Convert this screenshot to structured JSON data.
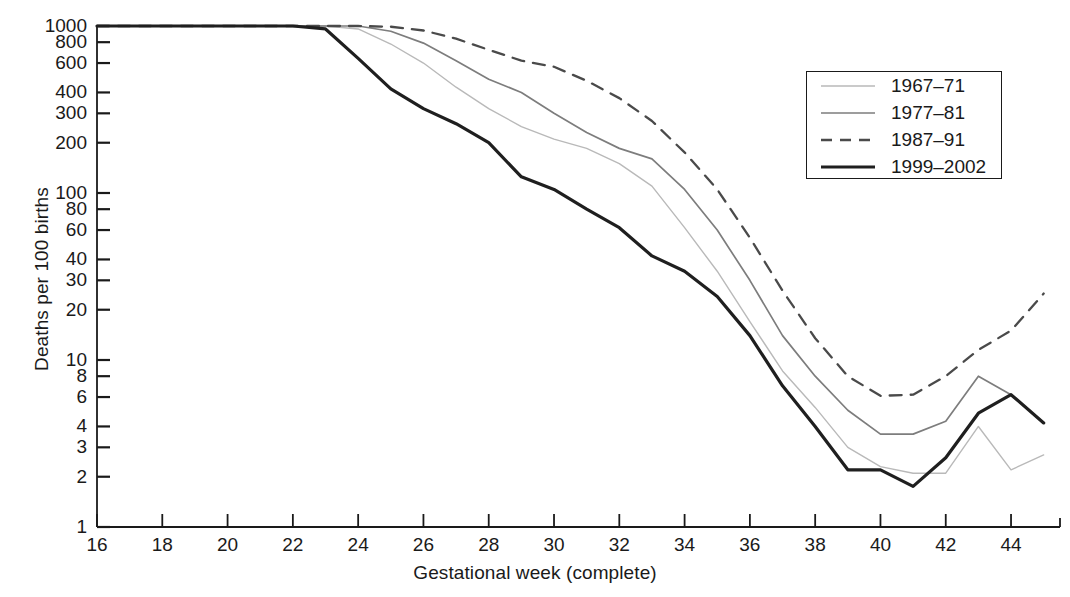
{
  "chart_data": {
    "type": "line",
    "title": "",
    "xlabel": "Gestational week (complete)",
    "ylabel": "Deaths per 100 births",
    "xlim": [
      16,
      45.5
    ],
    "ylim": [
      1,
      1000
    ],
    "yscale": "log",
    "grid": false,
    "legend_position": "top-right",
    "x_ticks": [
      16,
      18,
      20,
      22,
      24,
      26,
      28,
      30,
      32,
      34,
      36,
      38,
      40,
      42,
      44
    ],
    "x_tick_labels": [
      "16",
      "18",
      "20",
      "22",
      "24",
      "26",
      "28",
      "30",
      "32",
      "34",
      "36",
      "38",
      "40",
      "42",
      "44"
    ],
    "y_ticks": [
      1000,
      800,
      600,
      400,
      300,
      200,
      100,
      80,
      60,
      40,
      30,
      20,
      10,
      8,
      6,
      4,
      3,
      2,
      1
    ],
    "y_tick_labels": [
      "1000",
      "800",
      "600",
      "400",
      "300",
      "200",
      "100",
      "80",
      "60",
      "40",
      "30",
      "20",
      "10",
      "8",
      "6",
      "4",
      "3",
      "2",
      "1"
    ],
    "series": [
      {
        "name": "1967-71",
        "style": "solid",
        "color": "#b9b9b9",
        "width": 1.4,
        "x": [
          16,
          17,
          18,
          19,
          20,
          21,
          22,
          23,
          24,
          25,
          26,
          27,
          28,
          29,
          30,
          31,
          32,
          33,
          34,
          35,
          36,
          37,
          38,
          39,
          40,
          41,
          42,
          43,
          44,
          45
        ],
        "y": [
          1000,
          1000,
          1000,
          1000,
          1000,
          1000,
          1000,
          1000,
          960,
          780,
          600,
          430,
          320,
          250,
          210,
          185,
          150,
          110,
          62,
          34,
          17,
          8.6,
          5.2,
          3.0,
          2.3,
          2.1,
          2.1,
          4.0,
          2.2,
          2.7
        ]
      },
      {
        "name": "1977-81",
        "style": "solid",
        "color": "#7d7d7d",
        "width": 1.7,
        "x": [
          16,
          17,
          18,
          19,
          20,
          21,
          22,
          23,
          24,
          25,
          26,
          27,
          28,
          29,
          30,
          31,
          32,
          33,
          34,
          35,
          36,
          37,
          38,
          39,
          40,
          41,
          42,
          43,
          44,
          45
        ],
        "y": [
          1000,
          1000,
          1000,
          1000,
          1000,
          1000,
          1000,
          1000,
          1000,
          930,
          790,
          620,
          480,
          400,
          300,
          230,
          185,
          160,
          105,
          60,
          30,
          14,
          8.0,
          5.0,
          3.6,
          3.6,
          4.3,
          8.0,
          6.2,
          4.2
        ]
      },
      {
        "name": "1987-91",
        "style": "dashed",
        "color": "#4a4a4a",
        "width": 2.3,
        "x": [
          16,
          17,
          18,
          19,
          20,
          21,
          22,
          23,
          24,
          25,
          26,
          27,
          28,
          29,
          30,
          31,
          32,
          33,
          34,
          35,
          36,
          37,
          38,
          39,
          40,
          41,
          42,
          43,
          44,
          45
        ],
        "y": [
          1000,
          1000,
          1000,
          1000,
          1000,
          1000,
          1000,
          1000,
          1000,
          990,
          940,
          840,
          720,
          620,
          570,
          470,
          370,
          270,
          175,
          105,
          54,
          26,
          13.5,
          8.0,
          6.1,
          6.2,
          8.0,
          11.5,
          15.0,
          25.0
        ]
      },
      {
        "name": "1999-2002",
        "style": "solid",
        "color": "#1f1f1f",
        "width": 3.2,
        "x": [
          16,
          17,
          18,
          19,
          20,
          21,
          22,
          23,
          24,
          25,
          26,
          27,
          28,
          29,
          30,
          31,
          32,
          33,
          34,
          35,
          36,
          37,
          38,
          39,
          40,
          41,
          42,
          43,
          44,
          45
        ],
        "y": [
          1000,
          1000,
          1000,
          1000,
          1000,
          1000,
          1000,
          960,
          640,
          420,
          320,
          260,
          200,
          125,
          105,
          80,
          62,
          42,
          34,
          24,
          14,
          7.0,
          4.0,
          2.2,
          2.2,
          1.75,
          2.6,
          4.8,
          6.2,
          4.2
        ]
      }
    ]
  },
  "legend": {
    "items": [
      {
        "label": "1967-71",
        "style": "solid",
        "color": "#b9b9b9",
        "width": 1.4
      },
      {
        "label": "1977-81",
        "style": "solid",
        "color": "#7d7d7d",
        "width": 1.7
      },
      {
        "label": "1987-91",
        "style": "dashed",
        "color": "#4a4a4a",
        "width": 2.3
      },
      {
        "label": "1999-2002",
        "style": "solid",
        "color": "#1f1f1f",
        "width": 3.2
      }
    ]
  },
  "axes": {
    "y_title": "Deaths per 100 births",
    "x_title": "Gestational week (complete)",
    "axis_color": "#1a1a1a"
  }
}
